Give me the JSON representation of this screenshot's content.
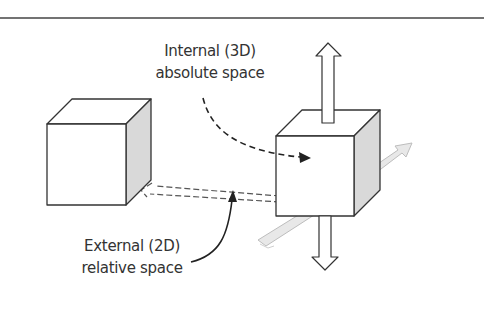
{
  "diagram": {
    "labels": {
      "internal": {
        "line1": "Internal (3D)",
        "line2": "absolute space"
      },
      "external": {
        "line1": "External (2D)",
        "line2": "relative space"
      }
    },
    "shapes": [
      {
        "name": "left-cube",
        "type": "cube",
        "shading": "right face gray"
      },
      {
        "name": "right-cube",
        "type": "cube",
        "shading": "right face gray"
      },
      {
        "name": "up-arrow",
        "type": "hollow block arrow",
        "direction": "up"
      },
      {
        "name": "down-arrow",
        "type": "hollow block arrow",
        "direction": "down"
      },
      {
        "name": "ribbon-arrow",
        "type": "light gray flat arrow",
        "direction": "diagonal, behind right cube"
      },
      {
        "name": "dashed-hollow-arrow",
        "type": "dashed outline arrow",
        "direction": "from right cube to left cube"
      },
      {
        "name": "internal-pointer",
        "type": "dashed curved arrow",
        "from": "Internal (3D) absolute space",
        "to": "right cube"
      },
      {
        "name": "external-pointer",
        "type": "solid curved arrow",
        "from": "External (2D) relative space",
        "to": "dashed-hollow-arrow"
      }
    ],
    "colors": {
      "stroke": "#333333",
      "side_face": "#d9d9d9",
      "ribbon": "#e6e6e6",
      "text": "#333333",
      "rule": "#444444"
    }
  }
}
